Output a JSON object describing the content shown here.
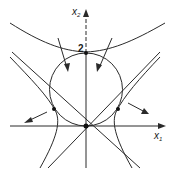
{
  "diagram": {
    "axes": {
      "x_label": "x",
      "x_label_sub": "1",
      "y_label": "x",
      "y_label_sub": "2"
    },
    "annotations": {
      "top_point_label": "2"
    },
    "colors": {
      "stroke": "#2a2a2a",
      "background": "#ffffff"
    },
    "elements": [
      "circle through origin with top at x2=2",
      "upper parabola-like curve tangent at (0,2)",
      "two lines through origin (slopes ±1)",
      "two hyperbola branches with asymptotes",
      "four arrows showing flow directions",
      "marked points: origin, top (0,2), left tangency, right tangency"
    ]
  }
}
